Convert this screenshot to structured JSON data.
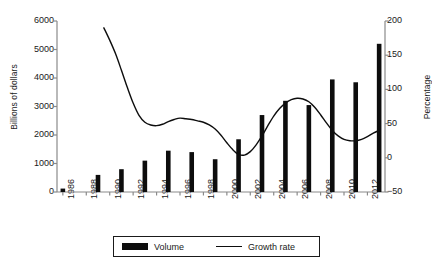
{
  "chart_data": {
    "type": "bar",
    "title": "",
    "subtitle": "",
    "xlabel": "",
    "ylabel": "Billions of dollars",
    "y2label": "Percentage",
    "grid": false,
    "legend_position": "bottom",
    "ylim": [
      0,
      6000
    ],
    "y2lim": [
      -50,
      200
    ],
    "xlim": [
      1985.5,
      2013.5
    ],
    "yticks": [
      "6000",
      "5000",
      "4000",
      "3000",
      "2000",
      "1000",
      "0"
    ],
    "ytick_values": [
      6000,
      5000,
      4000,
      3000,
      2000,
      1000,
      0
    ],
    "y2ticks": [
      "200",
      "150",
      "100",
      "50",
      "0",
      "-50"
    ],
    "y2tick_values": [
      200,
      150,
      100,
      50,
      0,
      -50
    ],
    "categories": [
      "1986",
      "1987",
      "1988",
      "1989",
      "1990",
      "1991",
      "1992",
      "1993",
      "1994",
      "1995",
      "1996",
      "1997",
      "1998",
      "1999",
      "2000",
      "2001",
      "2002",
      "2003",
      "2004",
      "2005",
      "2006",
      "2007",
      "2008",
      "2009",
      "2010",
      "2011",
      "2012",
      "2013"
    ],
    "xtick_labels": [
      "1986",
      "1988",
      "1990",
      "1992",
      "1994",
      "1996",
      "1998",
      "2000",
      "2002",
      "2004",
      "2006",
      "2008",
      "2010",
      "2012"
    ],
    "xtick_values": [
      1986,
      1988,
      1990,
      1992,
      1994,
      1996,
      1998,
      2000,
      2002,
      2004,
      2006,
      2008,
      2010,
      2012
    ],
    "series": [
      {
        "name": "Volume",
        "type": "bar",
        "axis": "left",
        "unit": "Billions of dollars",
        "color": "#0d0d0d",
        "x": [
          1986,
          1989,
          1991,
          1993,
          1995,
          1997,
          1999,
          2001,
          2003,
          2005,
          2007,
          2009,
          2011,
          2013
        ],
        "values": [
          120,
          600,
          800,
          1100,
          1450,
          1400,
          1150,
          1850,
          2700,
          3200,
          3050,
          3950,
          3850,
          5200
        ]
      },
      {
        "name": "Growth rate",
        "type": "line",
        "axis": "right",
        "unit": "Percentage",
        "color": "#0d0d0d",
        "x": [
          1989.5,
          1990,
          1990.5,
          1991,
          1991.5,
          1992,
          1992.5,
          1993,
          1993.5,
          1994,
          1994.5,
          1995,
          1995.5,
          1996,
          1996.5,
          1997,
          1997.5,
          1998,
          1998.5,
          1999,
          1999.5,
          2000,
          2000.5,
          2001,
          2001.5,
          2002,
          2002.5,
          2003,
          2003.5,
          2004,
          2004.5,
          2005,
          2005.5,
          2006,
          2006.5,
          2007,
          2007.5,
          2008,
          2008.5,
          2009,
          2009.5,
          2010,
          2010.5,
          2011,
          2011.5,
          2012,
          2012.5,
          2013
        ],
        "values": [
          190,
          172,
          152,
          128,
          103,
          80,
          62,
          52,
          48,
          47,
          49,
          53,
          56,
          58,
          57,
          56,
          54,
          52,
          48,
          42,
          33,
          22,
          12,
          5,
          4,
          9,
          19,
          32,
          47,
          61,
          72,
          80,
          85,
          87,
          86,
          82,
          74,
          63,
          51,
          40,
          32,
          27,
          25,
          25,
          27,
          31,
          36,
          40
        ]
      }
    ]
  },
  "legend": {
    "entries": [
      {
        "label": "Volume",
        "marker": "bar-swatch-icon"
      },
      {
        "label": "Growth rate",
        "marker": "line-swatch-icon"
      }
    ]
  }
}
